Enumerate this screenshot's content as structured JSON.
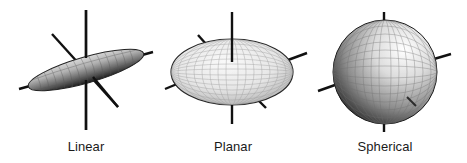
{
  "figure": {
    "panels": [
      {
        "id": "linear",
        "label": "Linear",
        "shape": "prolate-ellipsoid",
        "center_x": 86
      },
      {
        "id": "planar",
        "label": "Planar",
        "shape": "oblate-ellipsoid",
        "center_x": 232
      },
      {
        "id": "spherical",
        "label": "Spherical",
        "shape": "sphere",
        "center_x": 385
      }
    ]
  },
  "colors": {
    "axis": "#111111",
    "surface_light": "#f4f4f4",
    "surface_mid": "#a8a8a8",
    "surface_dark": "#1e1e1e",
    "grid": "#8a8a8a",
    "label": "#1a1a1a"
  }
}
